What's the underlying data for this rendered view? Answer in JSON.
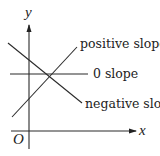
{
  "diagram": {
    "axes": {
      "x_label": "x",
      "y_label": "y",
      "origin_label": "O"
    },
    "lines": [
      {
        "name": "positive-slope",
        "label": "positive slope",
        "slope": "positive"
      },
      {
        "name": "zero-slope",
        "label": "0 slope",
        "slope": "zero"
      },
      {
        "name": "negative-slope",
        "label": "negative slope",
        "slope": "negative"
      }
    ],
    "colors": {
      "ink": "#222222",
      "background": "#ffffff"
    }
  }
}
